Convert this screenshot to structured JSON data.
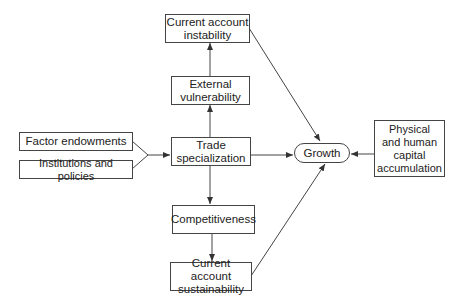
{
  "nodes": {
    "ca_instability": "Current account\ninstability",
    "ext_vulnerability": "External\nvulnerability",
    "factor_endowments": "Factor endowments",
    "institutions": "Institutions and policies",
    "trade_specialization": "Trade\nspecialization",
    "growth": "Growth",
    "capital_accumulation": "Physical\nand human\ncapital\naccumulation",
    "competitiveness": "Competitiveness",
    "ca_sustainability": "Current account\nsustainability"
  },
  "edges": [
    {
      "from": "factor_endowments",
      "to": "trade_specialization"
    },
    {
      "from": "institutions",
      "to": "trade_specialization"
    },
    {
      "from": "trade_specialization",
      "to": "ext_vulnerability"
    },
    {
      "from": "ext_vulnerability",
      "to": "ca_instability"
    },
    {
      "from": "trade_specialization",
      "to": "competitiveness"
    },
    {
      "from": "competitiveness",
      "to": "ca_sustainability"
    },
    {
      "from": "trade_specialization",
      "to": "growth"
    },
    {
      "from": "ca_instability",
      "to": "growth"
    },
    {
      "from": "ca_sustainability",
      "to": "growth"
    },
    {
      "from": "capital_accumulation",
      "to": "growth"
    }
  ]
}
